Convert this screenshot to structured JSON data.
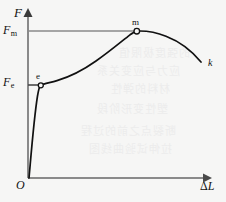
{
  "figure": {
    "background_color": "#f6f6f5",
    "axis_color": "#8a8a8a",
    "curve_color": "#111111",
    "labels": {
      "y_axis": "F",
      "x_axis_delta": "Δ",
      "x_axis_var": "L",
      "origin": "O",
      "f_max_base": "F",
      "f_max_sub": "m",
      "f_elastic_base": "F",
      "f_elastic_sub": "e",
      "point_e": "e",
      "point_m": "m",
      "point_k": "k"
    },
    "bleed_through_lines": [
      {
        "text": "的强度极限值",
        "x": 118,
        "y": 44
      },
      {
        "text": "应力与应变关系",
        "x": 96,
        "y": 62
      },
      {
        "text": "材料的弹性",
        "x": 110,
        "y": 80
      },
      {
        "text": "塑性变形阶段",
        "x": 96,
        "y": 100
      },
      {
        "text": "断裂点之前的过程",
        "x": 80,
        "y": 122
      },
      {
        "text": "拉伸试验曲线图",
        "x": 88,
        "y": 140
      }
    ]
  },
  "chart_data": {
    "type": "line",
    "title": "",
    "xlabel": "ΔL",
    "ylabel": "F",
    "grid": false,
    "legend": false,
    "xlim": [
      0,
      1
    ],
    "ylim": [
      0,
      1
    ],
    "axes": {
      "origin_label": "O",
      "y_ticks": [
        {
          "label": "F_e",
          "value": 0.63
        },
        {
          "label": "F_m",
          "value": 0.95
        }
      ],
      "x_ticks": []
    },
    "guide_lines": [
      {
        "name": "Fm-horizontal",
        "orientation": "horizontal",
        "value": 0.95,
        "from_x": 0.0,
        "to_x": 0.66
      },
      {
        "name": "Fe-horizontal",
        "orientation": "horizontal",
        "value": 0.63,
        "from_x": 0.0,
        "to_x": 0.07
      }
    ],
    "series": [
      {
        "name": "tensile-curve",
        "color": "#111111",
        "points": [
          {
            "x": 0.0,
            "y": 0.0
          },
          {
            "x": 0.018,
            "y": 0.2
          },
          {
            "x": 0.035,
            "y": 0.43
          },
          {
            "x": 0.055,
            "y": 0.6
          },
          {
            "x": 0.068,
            "y": 0.63
          },
          {
            "x": 0.105,
            "y": 0.66
          },
          {
            "x": 0.16,
            "y": 0.71
          },
          {
            "x": 0.24,
            "y": 0.775
          },
          {
            "x": 0.34,
            "y": 0.845
          },
          {
            "x": 0.45,
            "y": 0.898
          },
          {
            "x": 0.56,
            "y": 0.935
          },
          {
            "x": 0.66,
            "y": 0.952
          },
          {
            "x": 0.74,
            "y": 0.95
          },
          {
            "x": 0.82,
            "y": 0.925
          },
          {
            "x": 0.89,
            "y": 0.87
          },
          {
            "x": 0.95,
            "y": 0.79
          },
          {
            "x": 0.99,
            "y": 0.71
          }
        ]
      }
    ],
    "annotations": [
      {
        "label": "e",
        "x": 0.068,
        "y": 0.63,
        "marker": "open-circle"
      },
      {
        "label": "m",
        "x": 0.66,
        "y": 0.952,
        "marker": "open-circle"
      },
      {
        "label": "k",
        "x": 0.99,
        "y": 0.71,
        "marker": "none"
      }
    ]
  }
}
